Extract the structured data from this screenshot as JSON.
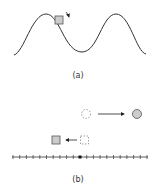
{
  "panels": [
    {
      "id": "a",
      "caption": "(a)",
      "description": "block sliding on a sinusoidal track"
    },
    {
      "id": "b",
      "caption": "(b)",
      "description": "lattice line with displaced circle and square"
    }
  ],
  "colors": {
    "stroke": "#333333",
    "fill_gray": "#cccccc",
    "dashed": "#888888"
  },
  "lattice": {
    "tick_count": 20,
    "center_index": 10
  }
}
